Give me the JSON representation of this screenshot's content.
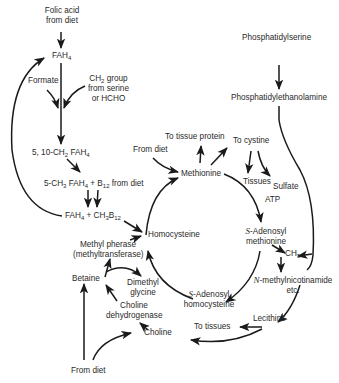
{
  "diagram": {
    "nodes": {
      "folic_acid_from_diet": {
        "line1": "Folic acid",
        "line2": "from diet"
      },
      "fah4": {
        "text": "FAH",
        "sub": "4"
      },
      "formate": {
        "text": "Formate"
      },
      "ch2_group": {
        "line1_a": "CH",
        "line1_sub": "2",
        "line1_b": " group",
        "line2": "from serine",
        "line3": "or HCHO"
      },
      "ch2_fah4": {
        "a": "5, 10-CH",
        "sub1": "2",
        "b": " FAH",
        "sub2": "4"
      },
      "ch3_fah4_b12": {
        "a": "5-CH",
        "sub1": "3",
        "b": " FAH",
        "sub2": "4",
        "c": " + B",
        "sub3": "12",
        "d": " from diet"
      },
      "fah4_ch3b12": {
        "a": "FAH",
        "sub1": "4",
        "b": " + CH",
        "sub2": "3",
        "c": "B",
        "sub3": "12"
      },
      "methyl_pherase": {
        "line1": "Methyl pherase",
        "line2": "(methyltransferase)"
      },
      "betaine": {
        "text": "Betaine"
      },
      "dimethyl_glycine": {
        "line1": "Dimethyl",
        "line2": "glycine"
      },
      "choline_dehydrogenase": {
        "line1": "Choline",
        "line2": "dehydrogenase"
      },
      "choline": {
        "text": "Choline"
      },
      "from_diet_bottom": {
        "text": "From diet"
      },
      "homocysteine": {
        "text": "Homocysteine"
      },
      "from_diet_methionine": {
        "text": "From diet"
      },
      "to_tissue_protein": {
        "text": "To tissue protein"
      },
      "methionine": {
        "text": "Methionine"
      },
      "to_cystine": {
        "text": "To cystine"
      },
      "tissues": {
        "text": "Tissues"
      },
      "sulfate": {
        "text": "Sulfate"
      },
      "atp": {
        "text": "ATP"
      },
      "s_adenosyl_methionine": {
        "prefix": "S",
        "line1": "-Adenosyl",
        "line2": "methionine"
      },
      "s_adenosyl_homocysteine": {
        "prefix": "S",
        "line1": "-Adenosyl",
        "line2": "homocysteine"
      },
      "ch3": {
        "text": "CH",
        "sub": "3"
      },
      "n_methylnicotinamide": {
        "prefix": "N",
        "line1": "-methylnicotinamide",
        "line2": "etc."
      },
      "phosphatidylserine": {
        "text": "Phosphatidylserine"
      },
      "phosphatidylethanolamine": {
        "text": "Phosphatidylethanolamine"
      },
      "lecithins": {
        "text": "Lecithins"
      },
      "to_tissues": {
        "text": "To tissues"
      }
    },
    "colors": {
      "ink": "#1a1a1a",
      "background": "#ffffff"
    }
  }
}
